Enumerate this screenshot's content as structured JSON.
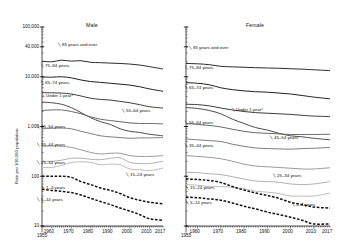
{
  "chart_data": {
    "type": "line",
    "title": "",
    "xlabel": "",
    "ylabel": "Rate per 100,000 population",
    "yscale": "log",
    "ylim": [
      10,
      100000
    ],
    "xlim": [
      1955,
      2017
    ],
    "grid": false,
    "legend_position": "inline-labels",
    "ytick_labels": [
      "100,000",
      "40,000",
      "10,000",
      "1,000",
      "100",
      "10"
    ],
    "ytick_values": [
      100000,
      40000,
      10000,
      1000,
      100,
      10
    ],
    "xtick_labels": [
      "1955",
      "1960",
      "1970",
      "1980",
      "1990",
      "2000",
      "2010",
      "2017"
    ],
    "xtick_values": [
      1955,
      1960,
      1970,
      1980,
      1990,
      2000,
      2010,
      2017
    ],
    "panels": [
      {
        "name": "male",
        "title": "Male",
        "series": [
          {
            "name": "85 years and over",
            "label": "85 years and over",
            "x": [
              1955,
              1960,
              1965,
              1970,
              1975,
              1980,
              1985,
              1990,
              1995,
              2000,
              2005,
              2010,
              2017
            ],
            "values": [
              20500,
              20000,
              21500,
              20600,
              21000,
              19500,
              19200,
              18800,
              18500,
              18000,
              17200,
              16000,
              14300
            ]
          },
          {
            "name": "75-84 years",
            "label": "75–84 years",
            "x": [
              1955,
              1960,
              1965,
              1970,
              1975,
              1980,
              1985,
              1990,
              1995,
              2000,
              2005,
              2010,
              2017
            ],
            "values": [
              9900,
              9800,
              10000,
              9500,
              8600,
              8000,
              7700,
              7400,
              7100,
              6800,
              6300,
              5700,
              5100
            ]
          },
          {
            "name": "65-74 years",
            "label": "65–74 years",
            "x": [
              1955,
              1960,
              1965,
              1970,
              1975,
              1980,
              1985,
              1990,
              1995,
              2000,
              2005,
              2010,
              2017
            ],
            "values": [
              4800,
              4750,
              4700,
              4500,
              4100,
              3700,
              3500,
              3400,
              3200,
              3000,
              2750,
              2500,
              2350
            ]
          },
          {
            "name": "Under 1 year",
            "label": "Under 1 year¹",
            "x": [
              1955,
              1960,
              1965,
              1970,
              1975,
              1980,
              1985,
              1990,
              1995,
              2000,
              2005,
              2010,
              2017
            ],
            "values": [
              3100,
              3000,
              2800,
              2400,
              1900,
              1500,
              1250,
              1100,
              900,
              800,
              760,
              700,
              650
            ]
          },
          {
            "name": "55-64 years",
            "label": "55–64 years",
            "x": [
              1955,
              1960,
              1965,
              1970,
              1975,
              1980,
              1985,
              1990,
              1995,
              2000,
              2005,
              2010,
              2017
            ],
            "values": [
              2100,
              2150,
              2150,
              2000,
              1800,
              1560,
              1400,
              1320,
              1250,
              1180,
              1150,
              1150,
              1130
            ]
          },
          {
            "name": "45-54 years",
            "label": "45–54 years",
            "x": [
              1955,
              1960,
              1965,
              1970,
              1975,
              1980,
              1985,
              1990,
              1995,
              2000,
              2005,
              2010,
              2017
            ],
            "values": [
              900,
              920,
              930,
              900,
              800,
              720,
              650,
              620,
              600,
              580,
              590,
              590,
              600
            ]
          },
          {
            "name": "35-44 years",
            "label": "35–44 years",
            "x": [
              1955,
              1960,
              1965,
              1970,
              1975,
              1980,
              1985,
              1990,
              1995,
              2000,
              2005,
              2010,
              2017
            ],
            "values": [
              400,
              405,
              400,
              380,
              340,
              300,
              280,
              290,
              290,
              260,
              250,
              250,
              260
            ]
          },
          {
            "name": "25-34 years",
            "label": "25–34 years",
            "x": [
              1955,
              1960,
              1965,
              1970,
              1975,
              1980,
              1985,
              1990,
              1995,
              2000,
              2005,
              2010,
              2017
            ],
            "values": [
              200,
              200,
              210,
              230,
              230,
              220,
              215,
              230,
              235,
              190,
              180,
              180,
              200
            ]
          },
          {
            "name": "15-24 years",
            "label": "15–24 years",
            "x": [
              1955,
              1960,
              1965,
              1970,
              1975,
              1980,
              1985,
              1990,
              1995,
              2000,
              2005,
              2010,
              2017
            ],
            "values": [
              150,
              150,
              165,
              190,
              195,
              190,
              170,
              175,
              170,
              140,
              135,
              130,
              145
            ]
          },
          {
            "name": "1-4 years",
            "label": "1–4 years",
            "x": [
              1955,
              1960,
              1965,
              1970,
              1975,
              1980,
              1985,
              1990,
              1995,
              2000,
              2005,
              2010,
              2017
            ],
            "values": [
              100,
              100,
              100,
              95,
              78,
              68,
              58,
              52,
              45,
              37,
              33,
              30,
              28
            ],
            "dashed": true
          },
          {
            "name": "5-14 years",
            "label": "5–14 years",
            "x": [
              1955,
              1960,
              1965,
              1970,
              1975,
              1980,
              1985,
              1990,
              1995,
              2000,
              2005,
              2010,
              2017
            ],
            "values": [
              55,
              52,
              50,
              47,
              42,
              36,
              31,
              27,
              23,
              20,
              17,
              14,
              13
            ],
            "dashed": true
          }
        ]
      },
      {
        "name": "female",
        "title": "Female",
        "series": [
          {
            "name": "85 years and over",
            "label": "85 years and over",
            "x": [
              1955,
              1960,
              1965,
              1970,
              1975,
              1980,
              1985,
              1990,
              1995,
              2000,
              2005,
              2010,
              2017
            ],
            "values": [
              18500,
              18200,
              17500,
              16200,
              15800,
              15500,
              15200,
              15000,
              14800,
              14500,
              14200,
              13800,
              13300
            ]
          },
          {
            "name": "75-84 years",
            "label": "75–84 years",
            "x": [
              1955,
              1960,
              1965,
              1970,
              1975,
              1980,
              1985,
              1990,
              1995,
              2000,
              2005,
              2010,
              2017
            ],
            "values": [
              7600,
              7400,
              6900,
              6000,
              5500,
              5200,
              5000,
              4900,
              4700,
              4500,
              4200,
              3900,
              3600
            ]
          },
          {
            "name": "65-74 years",
            "label": "65–74 years",
            "x": [
              1955,
              1960,
              1965,
              1970,
              1975,
              1980,
              1985,
              1990,
              1995,
              2000,
              2005,
              2010,
              2017
            ],
            "values": [
              2800,
              2750,
              2600,
              2350,
              2150,
              2000,
              1900,
              1850,
              1800,
              1750,
              1680,
              1620,
              1580
            ]
          },
          {
            "name": "Under 1 year",
            "label": "Under 1 year¹",
            "x": [
              1955,
              1960,
              1965,
              1970,
              1975,
              1980,
              1985,
              1990,
              1995,
              2000,
              2005,
              2010,
              2017
            ],
            "values": [
              2400,
              2300,
              2100,
              1800,
              1400,
              1150,
              950,
              850,
              730,
              650,
              620,
              580,
              540
            ]
          },
          {
            "name": "55-64 years",
            "label": "55–64 years",
            "x": [
              1955,
              1960,
              1965,
              1970,
              1975,
              1980,
              1985,
              1990,
              1995,
              2000,
              2005,
              2010,
              2017
            ],
            "values": [
              1150,
              1100,
              1050,
              980,
              880,
              800,
              750,
              730,
              710,
              690,
              690,
              690,
              700
            ]
          },
          {
            "name": "45-54 years",
            "label": "45–54 years",
            "x": [
              1955,
              1960,
              1965,
              1970,
              1975,
              1980,
              1985,
              1990,
              1995,
              2000,
              2005,
              2010,
              2017
            ],
            "values": [
              560,
              540,
              520,
              500,
              440,
              400,
              370,
              360,
              355,
              350,
              360,
              365,
              380
            ]
          },
          {
            "name": "35-44 years",
            "label": "35–44 years",
            "x": [
              1955,
              1960,
              1965,
              1970,
              1975,
              1980,
              1985,
              1990,
              1995,
              2000,
              2005,
              2010,
              2017
            ],
            "values": [
              260,
              250,
              240,
              225,
              200,
              175,
              160,
              155,
              150,
              145,
              140,
              140,
              148
            ]
          },
          {
            "name": "25-34 years",
            "label": "25–34 years",
            "x": [
              1955,
              1960,
              1965,
              1970,
              1975,
              1980,
              1985,
              1990,
              1995,
              2000,
              2005,
              2010,
              2017
            ],
            "values": [
              120,
              118,
              112,
              108,
              98,
              88,
              80,
              78,
              76,
              70,
              68,
              70,
              78
            ]
          },
          {
            "name": "15-24 years",
            "label": "15–24 years",
            "x": [
              1955,
              1960,
              1965,
              1970,
              1975,
              1980,
              1985,
              1990,
              1995,
              2000,
              2005,
              2010,
              2017
            ],
            "values": [
              68,
              66,
              62,
              62,
              60,
              56,
              50,
              48,
              45,
              40,
              40,
              40,
              46
            ]
          },
          {
            "name": "1-4 years",
            "label": "1–4 years",
            "x": [
              1955,
              1960,
              1965,
              1970,
              1975,
              1980,
              1985,
              1990,
              1995,
              2000,
              2005,
              2010,
              2017
            ],
            "values": [
              88,
              86,
              82,
              75,
              62,
              53,
              46,
              41,
              36,
              30,
              27,
              24,
              23
            ],
            "dashed": true
          },
          {
            "name": "5-14 years",
            "label": "5–14 years",
            "x": [
              1955,
              1960,
              1965,
              1970,
              1975,
              1980,
              1985,
              1990,
              1995,
              2000,
              2005,
              2010,
              2017
            ],
            "values": [
              38,
              37,
              35,
              33,
              29,
              25,
              22,
              19,
              17,
              15,
              13,
              11,
              11
            ],
            "dashed": true
          }
        ]
      }
    ],
    "label_positions": {
      "male": {
        "85 years and over": [
          62,
          42
        ],
        "75-84 years": [
          45,
          63
        ],
        "65-74 years": [
          45,
          80
        ],
        "Under 1 year": [
          46,
          93
        ],
        "55-64 years": [
          126,
          108
        ],
        "45-54 years": [
          41,
          124
        ],
        "35-44 years": [
          41,
          142
        ],
        "25-34 years": [
          41,
          160
        ],
        "15-24 years": [
          130,
          172
        ],
        "1-4 years": [
          46,
          185
        ],
        "5-14 years": [
          41,
          197
        ]
      },
      "female": {
        "85 years and over": [
          193,
          45
        ],
        "75-84 years": [
          189,
          65
        ],
        "65-74 years": [
          189,
          85
        ],
        "Under 1 year": [
          236,
          107
        ],
        "55-64 years": [
          189,
          120
        ],
        "45-54 years": [
          274,
          135
        ],
        "35-44 years": [
          189,
          143
        ],
        "25-34 years": [
          277,
          173
        ],
        "15-24 years": [
          190,
          185
        ],
        "1-4 years": [
          296,
          202
        ],
        "5-14 years": [
          190,
          200
        ]
      }
    }
  }
}
